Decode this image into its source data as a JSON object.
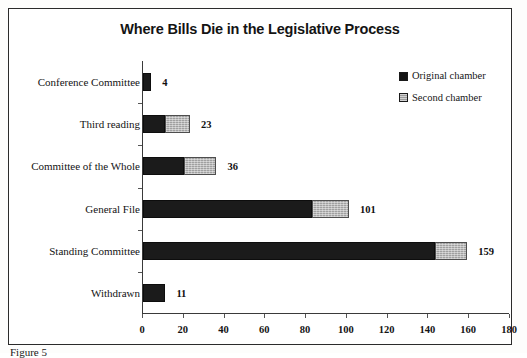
{
  "figure": {
    "caption": "Figure 5"
  },
  "chart_data": {
    "type": "bar",
    "orientation": "horizontal",
    "stacked": true,
    "title": "Where Bills Die in the Legislative Process",
    "xlabel": "",
    "ylabel": "",
    "xlim": [
      0,
      180
    ],
    "xticks": [
      0,
      20,
      40,
      60,
      80,
      100,
      120,
      140,
      160,
      180
    ],
    "grid": false,
    "legend_position": "top-right",
    "categories": [
      "Conference Committee",
      "Third reading",
      "Committee of the Whole",
      "General File",
      "Standing Committee",
      "Withdrawn"
    ],
    "series": [
      {
        "name": "Original chamber",
        "color": "#1b1b1b",
        "values": [
          4,
          11,
          20,
          83,
          143,
          11
        ]
      },
      {
        "name": "Second chamber",
        "color": "#a0a0a0",
        "values": [
          0,
          12,
          16,
          18,
          16,
          0
        ]
      }
    ],
    "totals": [
      4,
      23,
      36,
      101,
      159,
      11
    ],
    "data_labels": [
      "4",
      "23",
      "36",
      "101",
      "159",
      "11"
    ]
  }
}
